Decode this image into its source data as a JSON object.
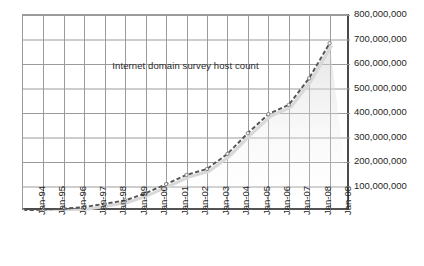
{
  "chart_data": {
    "type": "line",
    "title": "Internet domain survey host count",
    "xlabel": "",
    "ylabel": "",
    "grid": true,
    "legend": false,
    "ylim": [
      0,
      800000000
    ],
    "ytick_labels": [
      "800,000,000",
      "700,000,000",
      "600,000,000",
      "500,000,000",
      "400,000,000",
      "300,000,000",
      "200,000,000",
      "100,000,000"
    ],
    "ytick_values": [
      800000000,
      700000000,
      600000000,
      500000000,
      400000000,
      300000000,
      200000000,
      100000000
    ],
    "categories": [
      "Jan-94",
      "Jan-95",
      "Jan-96",
      "Jan-97",
      "Jan-98",
      "Jan-99",
      "Jan-00",
      "Jan-01",
      "Jan-02",
      "Jan-03",
      "Jan-04",
      "Jan-05",
      "Jan-06",
      "Jan-07",
      "Jan-08",
      "Jan-08"
    ],
    "series": [
      {
        "name": "Internet domain survey host count",
        "style": "dashed",
        "color": "#555555",
        "values": [
          2200000,
          5800000,
          9500000,
          16100000,
          29700000,
          43200000,
          72400000,
          109600000,
          147300000,
          171600000,
          233100000,
          317600000,
          394900000,
          433200000,
          541700000,
          685000000
        ]
      }
    ]
  },
  "axis": {
    "y_label_color": "#1f1f1f",
    "x_label_color": "#1f1f1f",
    "grid_color": "#9b9b9b",
    "frame_color": "#4a4a4a",
    "line_color": "#555555",
    "shadow_color": "#d8d8d8"
  }
}
